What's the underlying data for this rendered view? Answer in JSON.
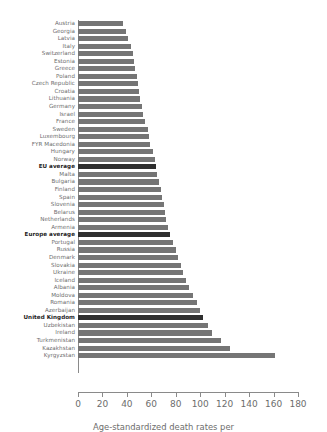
{
  "chart_data": {
    "type": "bar",
    "orientation": "horizontal",
    "title": "",
    "xlabel": "Age-standardized death rates per",
    "ylabel": "",
    "xlim": [
      0,
      180
    ],
    "xticks": [
      0,
      20,
      40,
      60,
      80,
      100,
      120,
      140,
      160,
      180
    ],
    "grid": false,
    "legend": "none",
    "bar_color": "#757575",
    "highlight_color": "#2f2f2f",
    "categories": [
      "Austria",
      "Georgia",
      "Latvia",
      "Italy",
      "Switzerland",
      "Estonia",
      "Greece",
      "Poland",
      "Czech Republic",
      "Croatia",
      "Lithuania",
      "Germany",
      "Israel",
      "France",
      "Sweden",
      "Luxembourg",
      "FYR Macedonia",
      "Hungary",
      "Norway",
      "EU average",
      "Malta",
      "Bulgaria",
      "Finland",
      "Spain",
      "Slovenia",
      "Belarus",
      "Netherlands",
      "Armenia",
      "Europe average",
      "Portugal",
      "Russia",
      "Denmark",
      "Slovakia",
      "Ukraine",
      "Iceland",
      "Albania",
      "Moldova",
      "Romania",
      "Azerbaijan",
      "United Kingdom",
      "Uzbekistan",
      "Ireland",
      "Turkmenistan",
      "Kazakhstan",
      "Kyrgyzstan"
    ],
    "values": [
      37,
      39,
      41,
      43,
      45,
      46,
      47,
      48,
      49,
      50,
      51,
      52,
      53,
      55,
      57,
      58,
      59,
      61,
      63,
      64,
      65,
      66,
      68,
      69,
      70,
      71,
      72,
      74,
      75,
      78,
      80,
      82,
      84,
      86,
      88,
      91,
      94,
      97,
      100,
      102,
      106,
      110,
      117,
      124,
      161
    ],
    "highlighted": [
      "EU average",
      "Europe average",
      "United Kingdom"
    ]
  }
}
